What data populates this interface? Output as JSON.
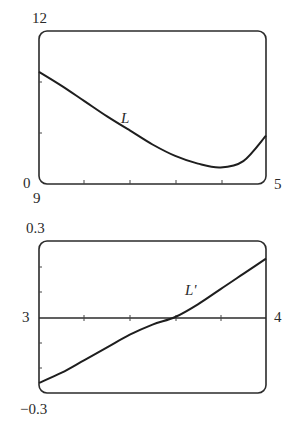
{
  "chart_data": [
    {
      "type": "line",
      "title": "",
      "series": [
        {
          "name": "L",
          "x": [
            0,
            0.5,
            1,
            1.5,
            2,
            2.5,
            3,
            3.5,
            4,
            4.5,
            5
          ],
          "values": [
            8.8,
            7.7,
            6.5,
            5.3,
            4.2,
            3.1,
            2.2,
            1.6,
            1.3,
            1.8,
            3.8
          ]
        }
      ],
      "curve_label": "L",
      "y_top_label": "12",
      "y_bottom_label": "0",
      "x_left_label": "9",
      "x_right_label": "5",
      "ylim": [
        0,
        12
      ],
      "x_ticks_count": 4,
      "y_ticks_count": 2,
      "grid": false
    },
    {
      "type": "line",
      "title": "",
      "series": [
        {
          "name": "L'",
          "x": [
            3,
            3.1,
            3.2,
            3.3,
            3.4,
            3.5,
            3.6,
            3.7,
            3.8,
            3.9,
            4
          ],
          "values": [
            -0.26,
            -0.22,
            -0.17,
            -0.12,
            -0.07,
            -0.03,
            0.0,
            0.05,
            0.11,
            0.17,
            0.23
          ]
        }
      ],
      "curve_label": "L'",
      "y_top_label": "0.3",
      "y_bottom_label": "−0.3",
      "x_left_label": "3",
      "x_right_label": "4",
      "ylim": [
        -0.3,
        0.3
      ],
      "xlim": [
        3,
        4
      ],
      "zero_crossing_x": 3.6,
      "x_ticks_count": 4,
      "y_ticks_count": 4,
      "grid": false
    }
  ]
}
